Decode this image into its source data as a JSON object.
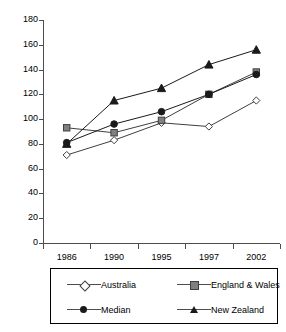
{
  "chart_data": {
    "type": "line",
    "title": "",
    "xlabel": "",
    "ylabel": "",
    "categories": [
      "1986",
      "1990",
      "1995",
      "1997",
      "2002"
    ],
    "ylim": [
      0,
      180
    ],
    "yticks": [
      0,
      20,
      40,
      60,
      80,
      100,
      120,
      140,
      160,
      180
    ],
    "grid": false,
    "legend_position": "bottom",
    "series": [
      {
        "name": "Australia",
        "marker": "open-diamond",
        "color": "#3f3f3f",
        "fill": "#ffffff",
        "values": [
          71,
          83,
          97,
          94,
          115
        ]
      },
      {
        "name": "England & Wales",
        "marker": "filled-square",
        "color": "#3f3f3f",
        "fill": "#808080",
        "values": [
          93,
          89,
          99,
          120,
          138
        ]
      },
      {
        "name": "Median",
        "marker": "filled-circle",
        "color": "#1a1a1a",
        "fill": "#1a1a1a",
        "values": [
          81,
          96,
          106,
          120,
          136
        ]
      },
      {
        "name": "New Zealand",
        "marker": "filled-triangle",
        "color": "#1a1a1a",
        "fill": "#1a1a1a",
        "values": [
          80,
          115,
          125,
          144,
          156
        ]
      }
    ]
  },
  "legend": {
    "entries": [
      {
        "label": "Australia",
        "marker": "open-diamond"
      },
      {
        "label": "England & Wales",
        "marker": "filled-square"
      },
      {
        "label": "Median",
        "marker": "filled-circle"
      },
      {
        "label": "New Zealand",
        "marker": "filled-triangle"
      }
    ]
  },
  "axis": {
    "line_color": "#4d4d4d"
  }
}
